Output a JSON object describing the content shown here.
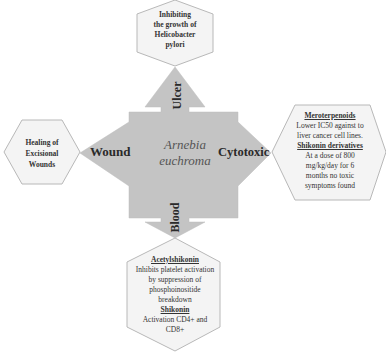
{
  "center": {
    "line1": "Arnebia",
    "line2": "euchroma"
  },
  "arrows": {
    "up": "Ulcer",
    "left": "Wound",
    "right": "Cytotoxic",
    "down": "Blood"
  },
  "hexagons": {
    "top": {
      "lines": [
        "Inhibiting",
        "the growth of",
        "Helicobacter",
        "pylori"
      ]
    },
    "left": {
      "lines": [
        "Healing of",
        "Excisional",
        "Wounds"
      ]
    },
    "right": {
      "heading1": "Meroterpenoids",
      "text1": [
        "Lower IC50 against to",
        "liver cancer cell lines."
      ],
      "heading2": "Shikonin derivatives",
      "text2": [
        "At a dose of 800",
        "mg/kg/day for 6",
        "months no toxic",
        "symptoms found"
      ]
    },
    "bottom": {
      "heading1": "Acetylshikonin",
      "text1": [
        "Inhibits platelet activation",
        "by suppression of",
        "phosphoinositide",
        "breakdown"
      ],
      "heading2": "Shikonin",
      "text2": [
        "Activation CD4+ and",
        "CD8+"
      ]
    }
  },
  "colors": {
    "arrow_fill": "#c4c4c4",
    "hex_fill": "#f4f4f4",
    "hex_stroke": "#b8b8b8"
  }
}
